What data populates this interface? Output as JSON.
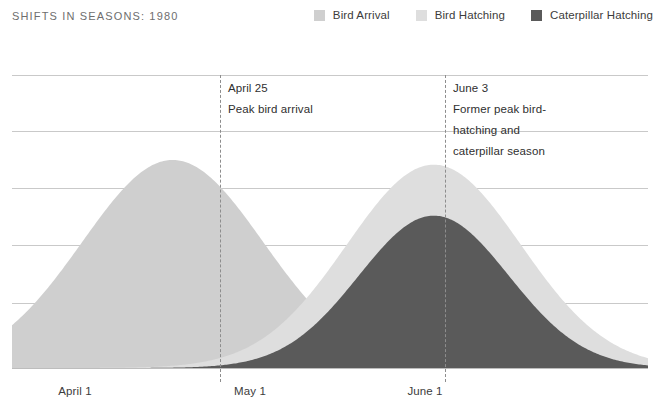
{
  "header": {
    "title": "SHIFTS IN SEASONS: 1980"
  },
  "legend": {
    "position": "top-right",
    "items": [
      {
        "label": "Bird Arrival",
        "color": "#cfcfcf",
        "key": "bird-arrival"
      },
      {
        "label": "Bird Hatching",
        "color": "#dedede",
        "key": "bird-hatching"
      },
      {
        "label": "Caterpillar Hatching",
        "color": "#5a5a5a",
        "key": "caterpillar-hatching"
      }
    ]
  },
  "annotations": [
    {
      "key": "april-25",
      "x": 220,
      "date": "April 25",
      "lines": [
        "Peak bird arrival"
      ]
    },
    {
      "key": "june-3",
      "x": 445,
      "date": "June 3",
      "lines": [
        "Former peak bird-",
        "hatching and",
        "caterpillar season"
      ]
    }
  ],
  "axis": {
    "x_ticks": [
      {
        "label": "April 1",
        "x": 75
      },
      {
        "label": "May 1",
        "x": 250
      },
      {
        "label": "June 1",
        "x": 425
      }
    ],
    "gridlines_y": [
      75,
      131,
      188,
      245,
      303,
      368
    ],
    "grid": true
  },
  "chart_data": {
    "type": "area",
    "title": "SHIFTS IN SEASONS: 1980",
    "xlabel": "",
    "ylabel": "",
    "grid": true,
    "legend_position": "top-right",
    "x_tick_labels": [
      "April 1",
      "May 1",
      "June 1"
    ],
    "x_tick_values": [
      0,
      30,
      61
    ],
    "xlim": [
      0,
      95
    ],
    "ylim": [
      0,
      5
    ],
    "y_gridline_values": [
      0,
      1,
      2,
      3,
      4,
      5
    ],
    "annotations": [
      {
        "date": "April 25",
        "text": "Peak bird arrival",
        "x_value": 24
      },
      {
        "date": "June 3",
        "text": "Former peak bird-hatching and caterpillar season",
        "x_value": 63
      }
    ],
    "series": [
      {
        "name": "Bird Arrival",
        "color": "#cfcfcf",
        "peak_x_value": 24,
        "peak_label": "April 25",
        "peak_height": 3.55,
        "spread": 13.5
      },
      {
        "name": "Bird Hatching",
        "color": "#dedede",
        "peak_x_value": 63,
        "peak_label": "June 3",
        "peak_height": 3.47,
        "spread": 13.0
      },
      {
        "name": "Caterpillar Hatching",
        "color": "#5a5a5a",
        "peak_x_value": 63,
        "peak_label": "June 3",
        "peak_height": 2.6,
        "spread": 11.2
      }
    ]
  }
}
